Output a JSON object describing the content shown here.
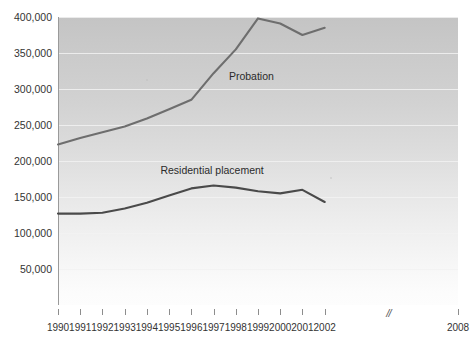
{
  "chart_data": {
    "type": "line",
    "title": "",
    "subtitle": "",
    "xlabel": "",
    "ylabel": "",
    "x": [
      1990,
      1991,
      1992,
      1993,
      1994,
      1995,
      1996,
      1997,
      1998,
      1999,
      2000,
      2001,
      2002
    ],
    "x_tick_labels": [
      "1990",
      "1991",
      "1992",
      "1993",
      "1994",
      "1995",
      "1996",
      "1997",
      "1998",
      "1999",
      "2000",
      "2001",
      "2002",
      "2008"
    ],
    "axis_break_marker": "//",
    "axis_break_after": "2002",
    "y_tick_labels": [
      "400,000",
      "350,000",
      "300,000",
      "250,000",
      "200,000",
      "150,000",
      "100,000",
      "50,000"
    ],
    "y_tick_values": [
      400000,
      350000,
      300000,
      250000,
      200000,
      150000,
      100000,
      50000
    ],
    "ylim": [
      0,
      400000
    ],
    "xlim": [
      1990,
      2008
    ],
    "grid": true,
    "grid_axis": "y",
    "legend": "inline-labels",
    "series": [
      {
        "name": "Probation",
        "color": "#6e6e6e",
        "label_x_year": 1997.6,
        "label_y_value": 318000,
        "values": [
          223000,
          232000,
          240000,
          248000,
          259000,
          272000,
          285000,
          322000,
          355000,
          398000,
          391000,
          375000,
          385000
        ]
      },
      {
        "name": "Residential placement",
        "color": "#4a4a4a",
        "label_x_year": 1996.5,
        "label_y_value": 188000,
        "values": [
          127000,
          127000,
          128000,
          134000,
          142000,
          152000,
          162000,
          166000,
          163000,
          158000,
          155000,
          160000,
          143000
        ]
      }
    ],
    "annotations": [
      {
        "text": "Probation",
        "series": "Probation"
      },
      {
        "text": "Residential placement",
        "series": "Residential placement"
      }
    ]
  },
  "figure": {
    "background_color": "#ffffff",
    "plot_gradient_top": "#c4c4c4",
    "plot_gradient_bottom": "#fdfdfd",
    "gridline_color": "#f2f2f2",
    "axis_color": "#9a9a9a",
    "tick_color": "#8d8d8d",
    "text_color": "#333333",
    "cropped_top_text": ""
  }
}
